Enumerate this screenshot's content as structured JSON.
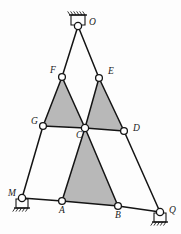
{
  "figure": {
    "background_color": "#fdfdfd",
    "member_color": "#141414",
    "shade_color": "#b8b8b8",
    "node_fill": "#ffffff",
    "node_stroke": "#141414",
    "label_color": "#1a1a1a"
  },
  "nodes": [
    {
      "id": "O",
      "label": "O",
      "x": 78,
      "y": 26,
      "label_x": 89,
      "label_y": 25,
      "radius": 3.6,
      "support": "pin-top"
    },
    {
      "id": "F",
      "label": "F",
      "x": 62,
      "y": 77,
      "label_x": 50,
      "label_y": 73,
      "radius": 3.4,
      "support": "none"
    },
    {
      "id": "E",
      "label": "E",
      "x": 99,
      "y": 78,
      "label_x": 108,
      "label_y": 74,
      "radius": 3.4,
      "support": "none"
    },
    {
      "id": "G",
      "label": "G",
      "x": 43,
      "y": 126,
      "label_x": 31,
      "label_y": 124,
      "radius": 3.4,
      "support": "none"
    },
    {
      "id": "C",
      "label": "C",
      "x": 85,
      "y": 128,
      "label_x": 76,
      "label_y": 138,
      "radius": 3.6,
      "support": "none"
    },
    {
      "id": "D",
      "label": "D",
      "x": 124,
      "y": 131,
      "label_x": 133,
      "label_y": 131,
      "radius": 3.4,
      "support": "none"
    },
    {
      "id": "A",
      "label": "A",
      "x": 62,
      "y": 201,
      "label_x": 59,
      "label_y": 213,
      "radius": 3.4,
      "support": "none"
    },
    {
      "id": "B",
      "label": "B",
      "x": 118,
      "y": 206,
      "label_x": 115,
      "label_y": 218,
      "radius": 3.4,
      "support": "none"
    },
    {
      "id": "M",
      "label": "M",
      "x": 22,
      "y": 198,
      "label_x": 8,
      "label_y": 196,
      "radius": 3.6,
      "support": "pin-bottom"
    },
    {
      "id": "Q",
      "label": "Q",
      "x": 160,
      "y": 212,
      "label_x": 169,
      "label_y": 213,
      "radius": 3.6,
      "support": "pin-bottom"
    }
  ],
  "members": [
    {
      "from": "O",
      "to": "F"
    },
    {
      "from": "O",
      "to": "E"
    },
    {
      "from": "F",
      "to": "G"
    },
    {
      "from": "F",
      "to": "C"
    },
    {
      "from": "E",
      "to": "C"
    },
    {
      "from": "E",
      "to": "D"
    },
    {
      "from": "G",
      "to": "C"
    },
    {
      "from": "C",
      "to": "D"
    },
    {
      "from": "G",
      "to": "M"
    },
    {
      "from": "D",
      "to": "Q"
    },
    {
      "from": "C",
      "to": "A"
    },
    {
      "from": "C",
      "to": "B"
    },
    {
      "from": "M",
      "to": "A"
    },
    {
      "from": "A",
      "to": "B"
    },
    {
      "from": "B",
      "to": "Q"
    }
  ],
  "shaded_triangles": [
    {
      "name": "triangle-FGC",
      "vertices": [
        "F",
        "G",
        "C"
      ]
    },
    {
      "name": "triangle-ECD",
      "vertices": [
        "E",
        "C",
        "D"
      ]
    },
    {
      "name": "triangle-CAB",
      "vertices": [
        "C",
        "A",
        "B"
      ]
    }
  ],
  "supports": [
    {
      "node": "O",
      "type": "pin-top",
      "orientation": "above",
      "hatch_count": 6,
      "bar_half_width": 9,
      "bar_offset": 11
    },
    {
      "node": "M",
      "type": "pin-bottom",
      "orientation": "below",
      "hatch_count": 5,
      "bar_half_width": 8,
      "bar_offset": 10
    },
    {
      "node": "Q",
      "type": "pin-bottom",
      "orientation": "below",
      "hatch_count": 5,
      "bar_half_width": 8,
      "bar_offset": 10
    }
  ],
  "labels": {
    "O": "O",
    "F": "F",
    "E": "E",
    "G": "G",
    "C": "C",
    "D": "D",
    "A": "A",
    "B": "B",
    "M": "M",
    "Q": "Q"
  }
}
